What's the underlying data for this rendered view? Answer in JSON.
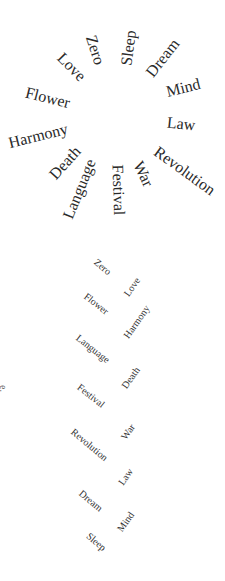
{
  "colors": {
    "background": "#ffffff",
    "text": "#2a2a2a"
  },
  "radial_cloud": {
    "words": [
      {
        "text": "Zero",
        "x": 95,
        "y": 50,
        "rot": 72
      },
      {
        "text": "Sleep",
        "x": 129,
        "y": 48,
        "rot": -82
      },
      {
        "text": "Dream",
        "x": 163,
        "y": 58,
        "rot": -52
      },
      {
        "text": "Love",
        "x": 71,
        "y": 67,
        "rot": 45
      },
      {
        "text": "Mind",
        "x": 183,
        "y": 88,
        "rot": -14
      },
      {
        "text": "Flower",
        "x": 48,
        "y": 98,
        "rot": 14
      },
      {
        "text": "Law",
        "x": 181,
        "y": 124,
        "rot": 6
      },
      {
        "text": "Harmony",
        "x": 38,
        "y": 136,
        "rot": -14
      },
      {
        "text": "Revolution",
        "x": 185,
        "y": 171,
        "rot": 36
      },
      {
        "text": "Death",
        "x": 65,
        "y": 163,
        "rot": -48
      },
      {
        "text": "Language",
        "x": 80,
        "y": 189,
        "rot": -68
      },
      {
        "text": "Festival",
        "x": 118,
        "y": 190,
        "rot": 88
      },
      {
        "text": "War",
        "x": 143,
        "y": 174,
        "rot": 64
      }
    ]
  },
  "zigzag_list": {
    "left": [
      {
        "text": "Zero",
        "x": 102,
        "y": 267,
        "rot": 40
      },
      {
        "text": "Flower",
        "x": 96,
        "y": 304,
        "rot": 38
      },
      {
        "text": "Language",
        "x": 93,
        "y": 349,
        "rot": 38
      },
      {
        "text": "Festival",
        "x": 91,
        "y": 396,
        "rot": 38
      },
      {
        "text": "Revolution",
        "x": 89,
        "y": 445,
        "rot": 40
      },
      {
        "text": "Dream",
        "x": 91,
        "y": 501,
        "rot": 40
      },
      {
        "text": "Sleep",
        "x": 96,
        "y": 542,
        "rot": 40
      }
    ],
    "right": [
      {
        "text": "Love",
        "x": 132,
        "y": 287,
        "rot": -55
      },
      {
        "text": "Harmony",
        "x": 137,
        "y": 322,
        "rot": -55
      },
      {
        "text": "Death",
        "x": 131,
        "y": 378,
        "rot": -55
      },
      {
        "text": "War",
        "x": 128,
        "y": 432,
        "rot": -55
      },
      {
        "text": "Law",
        "x": 126,
        "y": 477,
        "rot": -55
      },
      {
        "text": "Mind",
        "x": 126,
        "y": 522,
        "rot": -55
      }
    ]
  },
  "edge_fragments": [
    {
      "text": "e.",
      "x": 0,
      "y": 383
    },
    {
      "text": ".",
      "x": 0,
      "y": 490
    }
  ]
}
